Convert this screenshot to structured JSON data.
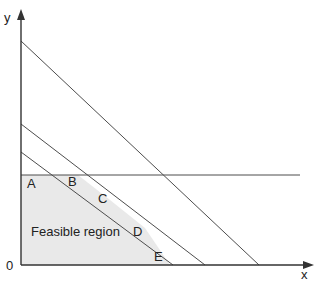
{
  "figure": {
    "type": "linear-programming-feasible-region-diagram",
    "background_color": "#ffffff",
    "line_color": "#4d4d4d",
    "axis_color": "#333333",
    "fill_color": "#e9e9e9",
    "text_color": "#222222"
  },
  "axes": {
    "x_label": "x",
    "y_label": "y",
    "origin_label": "0",
    "x_axis": {
      "y_px": 265,
      "x_start_px": 21,
      "x_end_px": 312,
      "arrow": true
    },
    "y_axis": {
      "x_px": 21,
      "y_start_px": 265,
      "y_end_px": 11,
      "arrow": true
    }
  },
  "region": {
    "label": "Feasible region",
    "fill_color": "#e9e9e9",
    "vertices": [
      {
        "name": "A",
        "label": "A",
        "x_px": 21,
        "y_px": 175
      },
      {
        "name": "B",
        "label": "B",
        "x_px": 78,
        "y_px": 175
      },
      {
        "name": "C",
        "label": "C",
        "x_px": 110,
        "y_px": 200
      },
      {
        "name": "D",
        "label": "D",
        "x_px": 145,
        "y_px": 228
      },
      {
        "name": "E",
        "label": "E",
        "x_px": 170,
        "y_px": 265
      }
    ]
  },
  "constraint_lines": [
    {
      "id": "line-1",
      "y_intercept_px": 41,
      "x_intercept_px": 259
    },
    {
      "id": "line-2",
      "y_intercept_px": 124,
      "x_intercept_px": 205
    },
    {
      "id": "line-3",
      "y_intercept_px": 152,
      "x_intercept_px": 173
    },
    {
      "id": "line-horizontal",
      "y_px": 175,
      "x_start_px": 21,
      "x_end_px": 300
    }
  ],
  "chart_data": {
    "type": "line",
    "title": "",
    "xlabel": "x",
    "ylabel": "y",
    "grid": false,
    "legend": "none",
    "annotations": [
      {
        "text": "Feasible region",
        "x_px": 31,
        "y_px": 234
      },
      {
        "text": "A",
        "x_px": 28,
        "y_px": 186
      },
      {
        "text": "B",
        "x_px": 70,
        "y_px": 184
      },
      {
        "text": "C",
        "x_px": 100,
        "y_px": 200
      },
      {
        "text": "D",
        "x_px": 136,
        "y_px": 234
      },
      {
        "text": "E",
        "x_px": 157,
        "y_px": 258
      },
      {
        "text": "0",
        "x_px": 10,
        "y_px": 270
      },
      {
        "text": "x",
        "x_px": 305,
        "y_px": 276
      },
      {
        "text": "y",
        "x_px": 8,
        "y_px": 22
      }
    ],
    "series": [
      {
        "name": "constraint-1",
        "x": [
          21,
          259
        ],
        "y": [
          41,
          265
        ]
      },
      {
        "name": "constraint-2",
        "x": [
          21,
          205
        ],
        "y": [
          124,
          265
        ]
      },
      {
        "name": "constraint-3",
        "x": [
          21,
          173
        ],
        "y": [
          152,
          265
        ]
      },
      {
        "name": "constraint-4",
        "x": [
          21,
          300
        ],
        "y": [
          175,
          175
        ]
      }
    ],
    "feasible_polygon": {
      "x": [
        21,
        21,
        78,
        110,
        145,
        170
      ],
      "y": [
        265,
        175,
        175,
        200,
        228,
        265
      ]
    }
  },
  "labels": {
    "A": "A",
    "B": "B",
    "C": "C",
    "D": "D",
    "E": "E",
    "region": "Feasible region",
    "origin": "0",
    "x_axis": "x",
    "y_axis": "y"
  }
}
